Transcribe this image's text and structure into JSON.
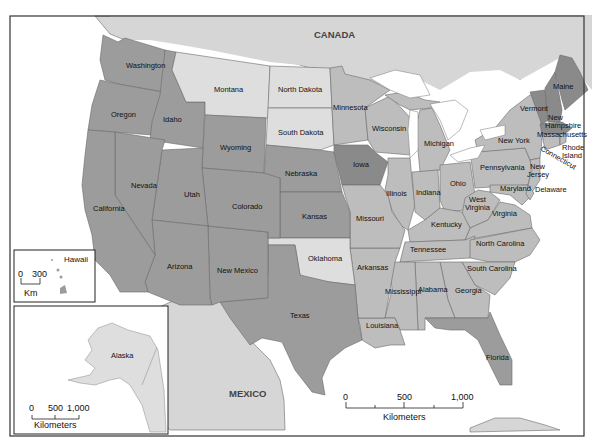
{
  "map": {
    "countries": {
      "canada": "CANADA",
      "mexico": "MEXICO"
    },
    "colors": {
      "water": "#ffffff",
      "foreign_land": "#d6d6d6",
      "shade_light": "#dedede",
      "shade_medium_light": "#bdbdbd",
      "shade_medium": "#9c9c9c",
      "shade_dark": "#8a8a8a",
      "border": "#333333"
    },
    "states": [
      {
        "name": "Washington",
        "label": "Washington",
        "shade": "medium"
      },
      {
        "name": "Oregon",
        "label": "Oregon",
        "shade": "medium"
      },
      {
        "name": "Idaho",
        "label": "Idaho",
        "shade": "medium"
      },
      {
        "name": "Montana",
        "label": "Montana",
        "shade": "light"
      },
      {
        "name": "North Dakota",
        "label": "North Dakota",
        "shade": "light"
      },
      {
        "name": "South Dakota",
        "label": "South Dakota",
        "shade": "light"
      },
      {
        "name": "Minnesota",
        "label": "Minnesota",
        "shade": "medium_light"
      },
      {
        "name": "Wisconsin",
        "label": "Wisconsin",
        "shade": "medium_light"
      },
      {
        "name": "Michigan",
        "label": "Michigan",
        "shade": "medium_light"
      },
      {
        "name": "New York",
        "label": "New York",
        "shade": "medium_light"
      },
      {
        "name": "Vermont",
        "label": "Vermont",
        "shade": "dark"
      },
      {
        "name": "New Hampshire",
        "label": "New Hampshire",
        "shade": "dark"
      },
      {
        "name": "Maine",
        "label": "Maine",
        "shade": "dark"
      },
      {
        "name": "Massachusetts",
        "label": "Massachusetts",
        "shade": "dark"
      },
      {
        "name": "Rhode Island",
        "label": "Rhode Island",
        "shade": "medium_light"
      },
      {
        "name": "Connecticut",
        "label": "Connecticut",
        "shade": "medium_light"
      },
      {
        "name": "New Jersey",
        "label": "New Jersey",
        "shade": "medium_light"
      },
      {
        "name": "Delaware",
        "label": "Delaware",
        "shade": "medium_light"
      },
      {
        "name": "Maryland",
        "label": "Maryland",
        "shade": "medium_light"
      },
      {
        "name": "Pennsylvania",
        "label": "Pennsylvania",
        "shade": "medium_light"
      },
      {
        "name": "Ohio",
        "label": "Ohio",
        "shade": "medium_light"
      },
      {
        "name": "West Virginia",
        "label": "West Virginia",
        "shade": "medium_light"
      },
      {
        "name": "Virginia",
        "label": "Virginia",
        "shade": "medium_light"
      },
      {
        "name": "Kentucky",
        "label": "Kentucky",
        "shade": "medium_light"
      },
      {
        "name": "Indiana",
        "label": "Indiana",
        "shade": "medium_light"
      },
      {
        "name": "Illinois",
        "label": "Illinois",
        "shade": "medium_light"
      },
      {
        "name": "Iowa",
        "label": "Iowa",
        "shade": "dark"
      },
      {
        "name": "Nebraska",
        "label": "Nebraska",
        "shade": "medium"
      },
      {
        "name": "Wyoming",
        "label": "Wyoming",
        "shade": "medium"
      },
      {
        "name": "Nevada",
        "label": "Nevada",
        "shade": "medium"
      },
      {
        "name": "California",
        "label": "California",
        "shade": "medium"
      },
      {
        "name": "Utah",
        "label": "Utah",
        "shade": "medium"
      },
      {
        "name": "Colorado",
        "label": "Colorado",
        "shade": "medium"
      },
      {
        "name": "Kansas",
        "label": "Kansas",
        "shade": "medium"
      },
      {
        "name": "Missouri",
        "label": "Missouri",
        "shade": "medium_light"
      },
      {
        "name": "Tennessee",
        "label": "Tennessee",
        "shade": "medium_light"
      },
      {
        "name": "North Carolina",
        "label": "North Carolina",
        "shade": "medium_light"
      },
      {
        "name": "South Carolina",
        "label": "South Carolina",
        "shade": "medium_light"
      },
      {
        "name": "Georgia",
        "label": "Georgia",
        "shade": "medium_light"
      },
      {
        "name": "Alabama",
        "label": "Alabama",
        "shade": "medium_light"
      },
      {
        "name": "Mississippi",
        "label": "Mississippi",
        "shade": "medium_light"
      },
      {
        "name": "Arkansas",
        "label": "Arkansas",
        "shade": "medium_light"
      },
      {
        "name": "Louisiana",
        "label": "Louisiana",
        "shade": "medium_light"
      },
      {
        "name": "Oklahoma",
        "label": "Oklahoma",
        "shade": "light"
      },
      {
        "name": "Texas",
        "label": "Texas",
        "shade": "medium"
      },
      {
        "name": "New Mexico",
        "label": "New Mexico",
        "shade": "medium"
      },
      {
        "name": "Arizona",
        "label": "Arizona",
        "shade": "medium"
      },
      {
        "name": "Florida",
        "label": "Florida",
        "shade": "medium"
      },
      {
        "name": "Alaska",
        "label": "Alaska",
        "shade": "light"
      },
      {
        "name": "Hawaii",
        "label": "Hawaii",
        "shade": "medium"
      }
    ],
    "labels": {
      "washington": "Washington",
      "oregon": "Oregon",
      "idaho": "Idaho",
      "montana": "Montana",
      "north_dakota": "North Dakota",
      "south_dakota": "South Dakota",
      "minnesota": "Minnesota",
      "wisconsin": "Wisconsin",
      "michigan": "Michigan",
      "new_york": "New York",
      "vermont": "Vermont",
      "new": "New",
      "hampshire": "Hampshire",
      "maine": "Maine",
      "massachusetts": "Massachusetts",
      "rhode": "Rhode",
      "island": "Island",
      "connecticut": "Connecticut",
      "new_jersey_1": "New",
      "new_jersey_2": "Jersey",
      "delaware": "Delaware",
      "maryland": "Maryland",
      "pennsylvania": "Pennsylvania",
      "ohio": "Ohio",
      "west": "West",
      "virginia_w": "Virginia",
      "virginia": "Virginia",
      "kentucky": "Kentucky",
      "indiana": "Indiana",
      "illinois": "Illinois",
      "iowa": "Iowa",
      "nebraska": "Nebraska",
      "wyoming": "Wyoming",
      "nevada": "Nevada",
      "california": "California",
      "utah": "Utah",
      "colorado": "Colorado",
      "kansas": "Kansas",
      "missouri": "Missouri",
      "tennessee": "Tennessee",
      "north_carolina": "North Carolina",
      "south_carolina": "South Carolina",
      "georgia": "Georgia",
      "alabama": "Alabama",
      "mississippi": "Mississippi",
      "arkansas": "Arkansas",
      "louisiana": "Louisiana",
      "oklahoma": "Oklahoma",
      "texas": "Texas",
      "new_mexico": "New Mexico",
      "arizona": "Arizona",
      "florida": "Florida",
      "alaska": "Alaska",
      "hawaii": "Hawaii"
    },
    "scale_bars": {
      "main": {
        "ticks": [
          "0",
          "500",
          "1,000"
        ],
        "unit": "Kilometers"
      },
      "alaska": {
        "ticks": [
          "0",
          "500",
          "1,000"
        ],
        "unit": "Kilometers"
      },
      "hawaii": {
        "ticks": [
          "0",
          "300"
        ],
        "unit": "Km"
      }
    }
  }
}
